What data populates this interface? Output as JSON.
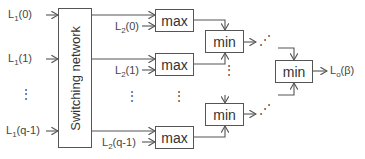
{
  "diagram": {
    "switch_label": "Switching network",
    "inputs": [
      {
        "base": "L",
        "sub": "1",
        "arg": "(0)"
      },
      {
        "base": "L",
        "sub": "1",
        "arg": "(1)"
      },
      {
        "base": "L",
        "sub": "1",
        "arg": "(q-1)"
      }
    ],
    "second_inputs": [
      {
        "base": "L",
        "sub": "2",
        "arg": "(0)"
      },
      {
        "base": "L",
        "sub": "2",
        "arg": "(1)"
      },
      {
        "base": "L",
        "sub": "2",
        "arg": "(q-1)"
      }
    ],
    "max_label": "max",
    "min_label": "min",
    "output": {
      "base": "L",
      "sub": "o",
      "arg": "(β)"
    },
    "ellipsis_v": "⋮",
    "ellipsis_d": "⋰"
  }
}
